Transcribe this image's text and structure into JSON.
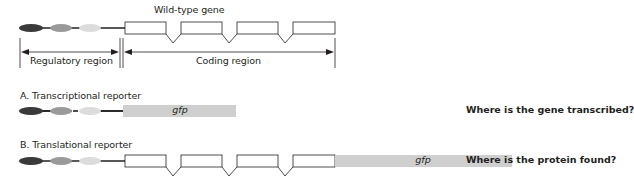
{
  "wild_type": {
    "title": "Wild-type gene",
    "regulatory_label": "Regulatory region",
    "coding_label": "Coding region"
  },
  "transcriptional": {
    "title": "A.  Transcriptional reporter",
    "reporter_label": "gfp",
    "question": "Where is the gene transcribed?"
  },
  "translational": {
    "title": "B.  Translational reporter",
    "reporter_label": "gfp",
    "question": "Where is the protein found?"
  },
  "colors": {
    "enhancer_dark": "#3a3a3a",
    "enhancer_mid": "#9a9a9a",
    "enhancer_light": "#dcdcdc",
    "gfp_fill": "#cfcfcf",
    "line": "#231f20"
  }
}
